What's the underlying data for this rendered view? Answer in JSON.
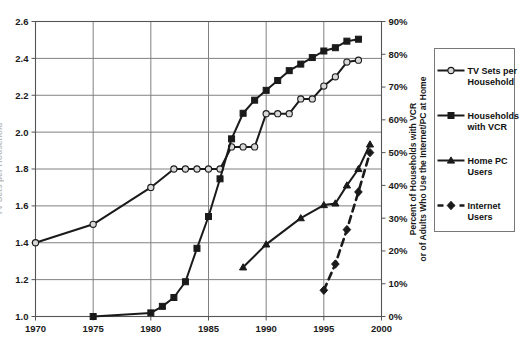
{
  "chart_data": {
    "type": "line",
    "title": "",
    "xlabel": "",
    "ylabel_left": "TV Sets per Household",
    "ylabel_right": "Percent of Households with VCR or of Adults Who Use the Internet/PC at Home",
    "xlim": [
      1970,
      2000
    ],
    "ylim_left": [
      1.0,
      2.6
    ],
    "ylim_right": [
      0,
      90
    ],
    "x_ticks": [
      "1970",
      "1975",
      "1980",
      "1985",
      "1990",
      "1995",
      "2000"
    ],
    "x_tick_values": [
      1970,
      1975,
      1980,
      1985,
      1990,
      1995,
      2000
    ],
    "y_ticks_left": [
      "1.0",
      "1.2",
      "1.4",
      "1.6",
      "1.8",
      "2.0",
      "2.2",
      "2.4",
      "2.6"
    ],
    "y_tick_values_left": [
      1.0,
      1.2,
      1.4,
      1.6,
      1.8,
      2.0,
      2.2,
      2.4,
      2.6
    ],
    "y_ticks_right": [
      "0%",
      "10%",
      "20%",
      "30%",
      "40%",
      "50%",
      "60%",
      "70%",
      "80%",
      "90%"
    ],
    "y_tick_values_right": [
      0,
      10,
      20,
      30,
      40,
      50,
      60,
      70,
      80,
      90
    ],
    "grid": true,
    "legend_position": "right",
    "series": [
      {
        "name": "TV Sets per Household",
        "axis": "left",
        "marker": "circle-open",
        "style": "solid",
        "x": [
          1970,
          1975,
          1980,
          1982,
          1983,
          1984,
          1985,
          1986,
          1987,
          1988,
          1989,
          1990,
          1991,
          1992,
          1993,
          1994,
          1995,
          1996,
          1997,
          1998
        ],
        "values": [
          1.4,
          1.5,
          1.7,
          1.8,
          1.8,
          1.8,
          1.8,
          1.8,
          1.92,
          1.92,
          1.92,
          2.1,
          2.1,
          2.1,
          2.18,
          2.18,
          2.25,
          2.3,
          2.38,
          2.39
        ]
      },
      {
        "name": "Households with VCR",
        "axis": "right",
        "marker": "square-filled",
        "style": "solid",
        "x": [
          1975,
          1980,
          1981,
          1982,
          1983,
          1984,
          1985,
          1986,
          1987,
          1988,
          1989,
          1990,
          1991,
          1992,
          1993,
          1994,
          1995,
          1996,
          1997,
          1998
        ],
        "values": [
          0.0,
          1.1,
          3.1,
          5.8,
          10.6,
          20.8,
          30.5,
          42.0,
          54.2,
          62.0,
          66.0,
          69.0,
          72.0,
          75.0,
          77.0,
          79.0,
          81.0,
          82.0,
          84.0,
          84.6
        ]
      },
      {
        "name": "Home PC Users",
        "axis": "right",
        "marker": "triangle-filled",
        "style": "solid",
        "x": [
          1988,
          1990,
          1993,
          1995,
          1996,
          1997,
          1998,
          1999
        ],
        "values": [
          15.0,
          22.0,
          30.0,
          34.0,
          34.5,
          40.0,
          45.0,
          52.5
        ]
      },
      {
        "name": "Internet Users",
        "axis": "right",
        "marker": "diamond-filled",
        "style": "dashed",
        "x": [
          1995,
          1996,
          1997,
          1998,
          1999
        ],
        "values": [
          8.0,
          16.0,
          26.5,
          38.0,
          50.0
        ]
      }
    ]
  },
  "legend": {
    "items": [
      {
        "label_line1": "TV Sets per",
        "label_line2": "Household",
        "marker": "circle-open",
        "style": "solid"
      },
      {
        "label_line1": "Households",
        "label_line2": "with VCR",
        "marker": "square-filled",
        "style": "solid"
      },
      {
        "label_line1": "Home PC",
        "label_line2": "Users",
        "marker": "triangle-filled",
        "style": "solid"
      },
      {
        "label_line1": "Internet",
        "label_line2": "Users",
        "marker": "diamond-filled",
        "style": "dashed"
      }
    ]
  },
  "axes": {
    "right_title_line1": "Percent of Households with VCR",
    "right_title_line2": "or of Adults Who Use the Internet/PC at Home",
    "left_title": "TV Sets per Household"
  },
  "caption": {
    "text": ""
  }
}
